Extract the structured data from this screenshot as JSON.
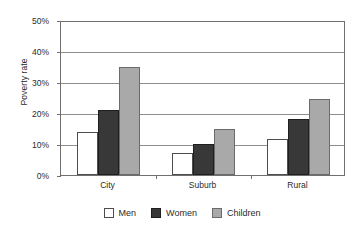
{
  "chart_data": {
    "type": "bar",
    "title": "",
    "subtitle": "",
    "xlabel": "",
    "ylabel": "Poverty rate",
    "categories": [
      "City",
      "Suburb",
      "Rural"
    ],
    "series": [
      {
        "name": "Men",
        "values": [
          14,
          7,
          11.5
        ],
        "color": "#ffffff"
      },
      {
        "name": "Women",
        "values": [
          21,
          10,
          18
        ],
        "color": "#383838"
      },
      {
        "name": "Children",
        "values": [
          35,
          15,
          24.5
        ],
        "color": "#a9a9a9"
      }
    ],
    "ylim": [
      0,
      50
    ],
    "ytick_values": [
      0,
      10,
      20,
      30,
      40,
      50
    ],
    "ytick_labels": [
      "0%",
      "10%",
      "20%",
      "30%",
      "40%",
      "50%"
    ],
    "grid": "horizontal",
    "legend_position": "bottom",
    "legend_entries": [
      "Men",
      "Women",
      "Children"
    ],
    "axis_color": "#6f6f6f",
    "gridline_color": "#8e8e8e",
    "background": "#ffffff"
  }
}
